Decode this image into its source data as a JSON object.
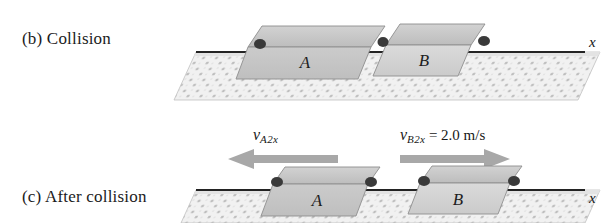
{
  "figure": {
    "type": "physics-diagram",
    "background_color": "#ffffff",
    "width": 610,
    "height": 223
  },
  "panels": [
    {
      "id": "b",
      "caption": "(b) Collision",
      "axis_label": "x",
      "gliders": [
        {
          "label": "A",
          "state": "in-contact"
        },
        {
          "label": "B",
          "state": "in-contact"
        }
      ]
    },
    {
      "id": "c",
      "caption": "(c) After collision",
      "axis_label": "x",
      "gliders": [
        {
          "label": "A",
          "state": "separated"
        },
        {
          "label": "B",
          "state": "separated"
        }
      ]
    }
  ],
  "annotations": {
    "velocity_a": {
      "symbol": "v",
      "subscript": "A2x",
      "value": "",
      "equals": "",
      "direction": "left",
      "arrow_color": "#a8a8a8"
    },
    "velocity_b": {
      "symbol": "v",
      "subscript": "B2x",
      "equals": "=",
      "value": "2.0 m/s",
      "direction": "right",
      "arrow_color": "#a8a8a8"
    }
  },
  "colors": {
    "glider_top": "#c9c9c9",
    "glider_front": "#c2c2c2",
    "glider_b_front": "#d2d2d2",
    "track_fill": "#efefef",
    "track_speckle": "#b9b9b9",
    "rail_line": "#2b2b2b",
    "bumper": "#3a3a3a",
    "outline": "#7a7a7a",
    "text": "#1b1b1b"
  }
}
